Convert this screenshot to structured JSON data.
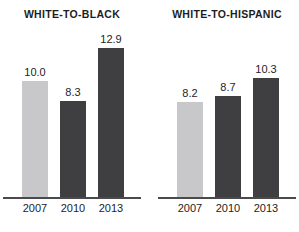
{
  "chart_data": {
    "type": "bar",
    "title": "",
    "xlabel": "",
    "ylabel": "",
    "grid": false,
    "legend": "none",
    "ylim": [
      0,
      17
    ],
    "categories": [
      "2007",
      "2010",
      "2013"
    ],
    "panels": [
      {
        "title": "WHITE-TO-BLACK",
        "categories": [
          "2007",
          "2010",
          "2013"
        ],
        "values": [
          10.0,
          8.3,
          12.9
        ],
        "value_labels": [
          "10.0",
          "8.3",
          "12.9"
        ],
        "bar_colors": [
          "#c8c8ca",
          "#3f3f42",
          "#3f3f42"
        ]
      },
      {
        "title": "WHITE-TO-HISPANIC",
        "categories": [
          "2007",
          "2010",
          "2013"
        ],
        "values": [
          8.2,
          8.7,
          10.3
        ],
        "value_labels": [
          "8.2",
          "8.7",
          "10.3"
        ],
        "bar_colors": [
          "#c8c8ca",
          "#3f3f42",
          "#3f3f42"
        ]
      }
    ],
    "colors": {
      "light_bar": "#c8c8ca",
      "dark_bar": "#3f3f42",
      "text": "#1d1d1f",
      "axis": "#4a4a4d",
      "background": "#ffffff"
    }
  }
}
